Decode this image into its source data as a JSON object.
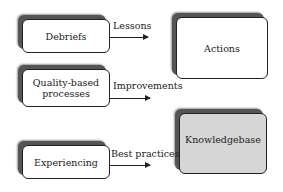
{
  "diagram": {
    "inputs": [
      {
        "label": "Debriefs",
        "flow": "Lessons"
      },
      {
        "label": "Quality-based processes",
        "flow": "Improvements"
      },
      {
        "label": "Experiencing",
        "flow": "Best practices"
      }
    ],
    "outputs": [
      {
        "label": "Actions",
        "fill": "#ffffff"
      },
      {
        "label": "Knowledgebase",
        "fill": "#d6d6d6"
      }
    ]
  }
}
